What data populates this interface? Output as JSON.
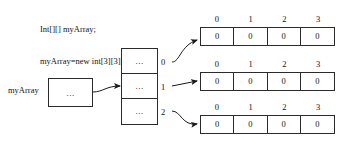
{
  "diagram": {
    "code": {
      "line1": "Int[][] myArray;",
      "line2": "myArray=new int[3][3];"
    },
    "variable": {
      "label": "myArray",
      "box_value": "..."
    },
    "pointer_column": {
      "cells": [
        {
          "index": "0",
          "value": "..."
        },
        {
          "index": "1",
          "value": "..."
        },
        {
          "index": "2",
          "value": "..."
        }
      ]
    },
    "rows": [
      {
        "name": "row-0",
        "headers": [
          "0",
          "1",
          "2",
          "3"
        ],
        "values": [
          "0",
          "0",
          "0",
          "0"
        ]
      },
      {
        "name": "row-1",
        "headers": [
          "0",
          "1",
          "2",
          "3"
        ],
        "values": [
          "0",
          "0",
          "0",
          "0"
        ]
      },
      {
        "name": "row-2",
        "headers": [
          "0",
          "1",
          "2",
          "3"
        ],
        "values": [
          "0",
          "0",
          "0",
          "0"
        ]
      }
    ],
    "colors": {
      "stroke": "#2b2b2b",
      "text": "#141414",
      "background": "#ffffff"
    }
  }
}
